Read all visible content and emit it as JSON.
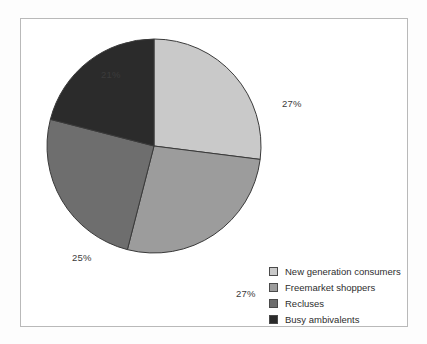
{
  "chart_data": {
    "type": "pie",
    "title": "",
    "categories": [
      "New generation consumers",
      "Freemarket shoppers",
      "Recluses",
      "Busy ambivalents"
    ],
    "values": [
      27,
      27,
      25,
      21
    ],
    "value_labels": [
      "27%",
      "27%",
      "25%",
      "21%"
    ],
    "units": "percent",
    "start_angle_deg": 0,
    "direction": "clockwise",
    "legend_position": "bottom-right",
    "grid": false,
    "colors": [
      "#c9c9c9",
      "#9c9c9c",
      "#6e6e6e",
      "#2b2b2b"
    ],
    "slice_border_color": "#3a3a3a",
    "frame_border_color": "#b9b9b9",
    "background_color": "#ffffff"
  },
  "labels": {
    "new_generation": "27%",
    "freemarket": "27%",
    "recluses": "25%",
    "busy_ambivalents": "21%"
  },
  "legend": {
    "items": [
      {
        "label": "New generation consumers",
        "color": "#c9c9c9"
      },
      {
        "label": "Freemarket shoppers",
        "color": "#9c9c9c"
      },
      {
        "label": "Recluses",
        "color": "#6e6e6e"
      },
      {
        "label": "Busy ambivalents",
        "color": "#2b2b2b"
      }
    ]
  }
}
